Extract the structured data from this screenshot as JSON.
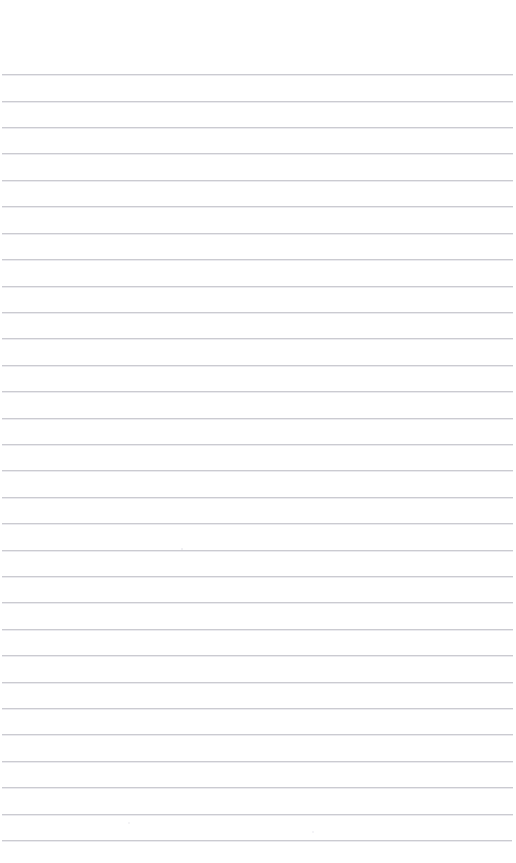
{
  "document": {
    "type": "blank-ruled-page",
    "title": "",
    "page_width": 516,
    "page_height": 863,
    "background_color": "#ffffff",
    "orientation": "portrait"
  },
  "ruling": {
    "line_color": "#c9c9cf",
    "line_thickness_px": 1,
    "line_spacing_px": 26.4,
    "first_line_y": 74,
    "last_line_y": 847,
    "line_count": 30,
    "line_start_x": 1,
    "line_end_x": 513,
    "top_margin_px": 74,
    "bottom_margin_px": 16,
    "left_margin_px": 1,
    "right_margin_px": 3,
    "has_vertical_margin_rule": false,
    "has_header_rule": false
  },
  "lines": [
    {
      "index": 1,
      "y": 74,
      "x1": 2,
      "x2": 513,
      "text": ""
    },
    {
      "index": 2,
      "y": 101,
      "x1": 2,
      "x2": 513,
      "text": ""
    },
    {
      "index": 3,
      "y": 127,
      "x1": 2,
      "x2": 513,
      "text": ""
    },
    {
      "index": 4,
      "y": 153,
      "x1": 2,
      "x2": 513,
      "text": ""
    },
    {
      "index": 5,
      "y": 180,
      "x1": 2,
      "x2": 513,
      "text": ""
    },
    {
      "index": 6,
      "y": 206,
      "x1": 2,
      "x2": 513,
      "text": ""
    },
    {
      "index": 7,
      "y": 233,
      "x1": 2,
      "x2": 513,
      "text": ""
    },
    {
      "index": 8,
      "y": 259,
      "x1": 2,
      "x2": 513,
      "text": ""
    },
    {
      "index": 9,
      "y": 286,
      "x1": 2,
      "x2": 513,
      "text": ""
    },
    {
      "index": 10,
      "y": 312,
      "x1": 2,
      "x2": 513,
      "text": ""
    },
    {
      "index": 11,
      "y": 338,
      "x1": 2,
      "x2": 513,
      "text": ""
    },
    {
      "index": 12,
      "y": 365,
      "x1": 2,
      "x2": 513,
      "text": ""
    },
    {
      "index": 13,
      "y": 391,
      "x1": 2,
      "x2": 513,
      "text": ""
    },
    {
      "index": 14,
      "y": 418,
      "x1": 2,
      "x2": 513,
      "text": ""
    },
    {
      "index": 15,
      "y": 444,
      "x1": 2,
      "x2": 513,
      "text": ""
    },
    {
      "index": 16,
      "y": 470,
      "x1": 2,
      "x2": 513,
      "text": ""
    },
    {
      "index": 17,
      "y": 497,
      "x1": 2,
      "x2": 513,
      "text": ""
    },
    {
      "index": 18,
      "y": 523,
      "x1": 2,
      "x2": 513,
      "text": ""
    },
    {
      "index": 19,
      "y": 550,
      "x1": 2,
      "x2": 513,
      "text": ""
    },
    {
      "index": 20,
      "y": 576,
      "x1": 2,
      "x2": 513,
      "text": ""
    },
    {
      "index": 21,
      "y": 602,
      "x1": 2,
      "x2": 513,
      "text": ""
    },
    {
      "index": 22,
      "y": 629,
      "x1": 2,
      "x2": 513,
      "text": ""
    },
    {
      "index": 23,
      "y": 655,
      "x1": 2,
      "x2": 513,
      "text": ""
    },
    {
      "index": 24,
      "y": 682,
      "x1": 2,
      "x2": 513,
      "text": ""
    },
    {
      "index": 25,
      "y": 708,
      "x1": 2,
      "x2": 513,
      "text": ""
    },
    {
      "index": 26,
      "y": 734,
      "x1": 2,
      "x2": 513,
      "text": ""
    },
    {
      "index": 27,
      "y": 761,
      "x1": 2,
      "x2": 513,
      "text": ""
    },
    {
      "index": 28,
      "y": 787,
      "x1": 2,
      "x2": 513,
      "text": ""
    },
    {
      "index": 29,
      "y": 814,
      "x1": 2,
      "x2": 513,
      "text": ""
    },
    {
      "index": 30,
      "y": 840,
      "x1": 2,
      "x2": 512,
      "text": ""
    }
  ],
  "marks": [
    {
      "name": "scan-speck",
      "x": 181,
      "y": 548,
      "color": "#ededf1"
    },
    {
      "name": "scan-speck",
      "x": 128,
      "y": 822,
      "color": "#f0f0f3"
    },
    {
      "name": "scan-speck",
      "x": 312,
      "y": 831,
      "color": "#f1f1f4"
    }
  ],
  "written_content": []
}
